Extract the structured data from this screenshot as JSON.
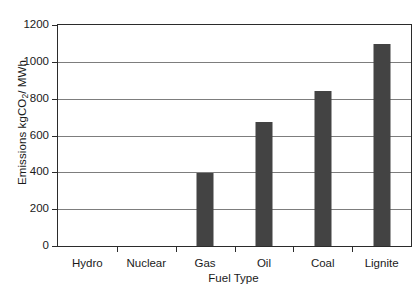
{
  "chart_data": {
    "type": "bar",
    "title": "",
    "xlabel": "Fuel Type",
    "ylabel": "Emissions kgCO2/ MWh",
    "ylabel_prefix": "Emissions kgCO",
    "ylabel_subscript": "2",
    "ylabel_suffix": "/ MWh",
    "categories": [
      "Hydro",
      "Nuclear",
      "Gas",
      "Oil",
      "Coal",
      "Lignite"
    ],
    "values": [
      0,
      0,
      395,
      675,
      840,
      1095
    ],
    "ylim": [
      0,
      1200
    ],
    "yticks": [
      0,
      200,
      400,
      600,
      800,
      1000,
      1200
    ],
    "ytick_labels": [
      "0",
      "200",
      "400",
      "600",
      "800",
      "1000",
      "1200"
    ],
    "grid": "horizontal",
    "legend": "none",
    "bar_color": "#434343",
    "gridline_color": "#7d7d7d",
    "axis_color": "#2b2b2b",
    "background": "#ffffff"
  }
}
